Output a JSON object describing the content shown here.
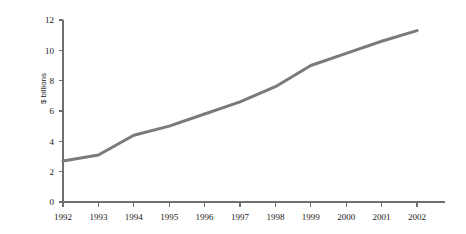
{
  "chart_data": {
    "type": "line",
    "title": "",
    "xlabel": "",
    "ylabel": "$ billions",
    "categories": [
      "1992",
      "1993",
      "1994",
      "1995",
      "1996",
      "1997",
      "1998",
      "1999",
      "2000",
      "2001",
      "2002"
    ],
    "x": [
      1992,
      1993,
      1994,
      1995,
      1996,
      1997,
      1998,
      1999,
      2000,
      2001,
      2002
    ],
    "series": [
      {
        "name": "",
        "values": [
          2.7,
          3.1,
          4.4,
          5.0,
          5.8,
          6.6,
          7.6,
          9.0,
          9.8,
          10.6,
          11.3
        ],
        "color": "#7a7a7a"
      }
    ],
    "ylim": [
      0,
      12
    ],
    "yticks": [
      0,
      2,
      4,
      6,
      8,
      10,
      12
    ],
    "ytick_labels": [
      "0",
      "2",
      "4",
      "6",
      "8",
      "10",
      "12"
    ],
    "xtick_labels": [
      "1992",
      "1993",
      "1994",
      "1995",
      "1996",
      "1997",
      "1998",
      "1999",
      "2000",
      "2001",
      "2002"
    ],
    "grid": false,
    "legend": false,
    "legend_position": "none"
  },
  "axes": {
    "y_axis_color": "#6f6f6f",
    "x_axis_color": "#6f6f6f",
    "tick_color": "#6f6f6f"
  },
  "colors": {
    "background": "#ffffff",
    "line": "#7a7a7a",
    "text": "#1a1a1a"
  }
}
